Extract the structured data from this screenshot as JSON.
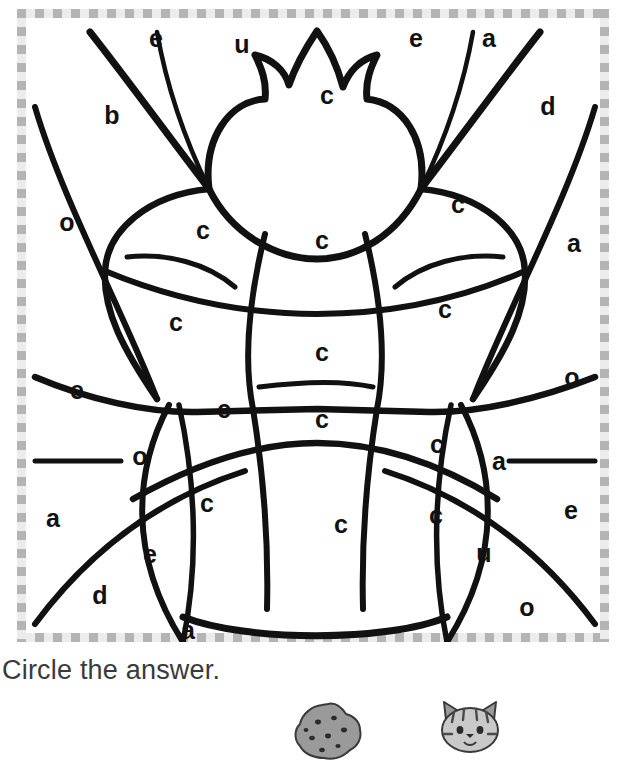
{
  "page": {
    "type": "color-by-letter-worksheet",
    "subject_outline": "beetle-bug",
    "background_color": "#ffffff",
    "line_color": "#111111",
    "frame_color_dark": "#b4b4b4",
    "frame_color_light": "#ececec"
  },
  "instruction": {
    "text": "Circle the answer."
  },
  "letters": [
    {
      "id": "l01",
      "char": "e",
      "x": 156,
      "y": 38
    },
    {
      "id": "l02",
      "char": "u",
      "x": 242,
      "y": 44
    },
    {
      "id": "l03",
      "char": "e",
      "x": 416,
      "y": 38
    },
    {
      "id": "l04",
      "char": "a",
      "x": 489,
      "y": 38
    },
    {
      "id": "l05",
      "char": "c",
      "x": 327,
      "y": 95
    },
    {
      "id": "l06",
      "char": "b",
      "x": 112,
      "y": 115
    },
    {
      "id": "l07",
      "char": "d",
      "x": 548,
      "y": 106
    },
    {
      "id": "l08",
      "char": "c",
      "x": 458,
      "y": 204
    },
    {
      "id": "l09",
      "char": "o",
      "x": 67,
      "y": 222
    },
    {
      "id": "l10",
      "char": "c",
      "x": 203,
      "y": 230
    },
    {
      "id": "l11",
      "char": "c",
      "x": 322,
      "y": 240
    },
    {
      "id": "l12",
      "char": "a",
      "x": 574,
      "y": 243
    },
    {
      "id": "l13",
      "char": "c",
      "x": 445,
      "y": 309
    },
    {
      "id": "l14",
      "char": "c",
      "x": 176,
      "y": 322
    },
    {
      "id": "l15",
      "char": "c",
      "x": 322,
      "y": 352
    },
    {
      "id": "l16",
      "char": "o",
      "x": 572,
      "y": 377
    },
    {
      "id": "l17",
      "char": "e",
      "x": 77,
      "y": 390
    },
    {
      "id": "l18",
      "char": "c",
      "x": 224,
      "y": 409
    },
    {
      "id": "l19",
      "char": "c",
      "x": 322,
      "y": 419
    },
    {
      "id": "l20",
      "char": "c",
      "x": 437,
      "y": 444
    },
    {
      "id": "l21",
      "char": "o",
      "x": 140,
      "y": 456
    },
    {
      "id": "l22",
      "char": "a",
      "x": 499,
      "y": 461
    },
    {
      "id": "l23",
      "char": "c",
      "x": 207,
      "y": 503
    },
    {
      "id": "l24",
      "char": "a",
      "x": 53,
      "y": 518
    },
    {
      "id": "l25",
      "char": "c",
      "x": 341,
      "y": 524
    },
    {
      "id": "l26",
      "char": "c",
      "x": 436,
      "y": 515
    },
    {
      "id": "l27",
      "char": "e",
      "x": 571,
      "y": 510
    },
    {
      "id": "l28",
      "char": "e",
      "x": 150,
      "y": 554
    },
    {
      "id": "l29",
      "char": "u",
      "x": 484,
      "y": 553
    },
    {
      "id": "l30",
      "char": "d",
      "x": 100,
      "y": 595
    },
    {
      "id": "l31",
      "char": "o",
      "x": 527,
      "y": 607
    },
    {
      "id": "l32",
      "char": "a",
      "x": 188,
      "y": 630
    }
  ],
  "choices": [
    {
      "id": "choice-cookie",
      "name": "cookie-picture"
    },
    {
      "id": "choice-cat",
      "name": "cat-picture"
    }
  ]
}
